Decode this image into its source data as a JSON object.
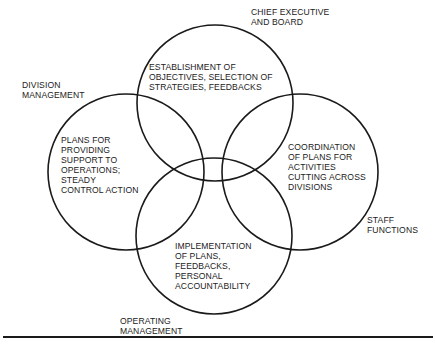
{
  "diagram": {
    "type": "venn",
    "circles": [
      {
        "id": "chief-executive",
        "label": "CHIEF EXECUTIVE\nAND BOARD",
        "text": "ESTABLISHMENT OF\nOBJECTIVES, SELECTION OF\nSTRATEGIES, FEEDBACKS",
        "cx": 215,
        "cy": 103,
        "r": 78
      },
      {
        "id": "division-management",
        "label": "DIVISION\nMANAGEMENT",
        "text": "PLANS FOR\nPROVIDING\nSUPPORT TO\nOPERATIONS;\nSTEADY\nCONTROL ACTION",
        "cx": 126,
        "cy": 172,
        "r": 78
      },
      {
        "id": "staff-functions",
        "label": "STAFF\nFUNCTIONS",
        "text": "COORDINATION\nOF PLANS FOR\nACTIVITIES\nCUTTING ACROSS\nDIVISIONS",
        "cx": 300,
        "cy": 172,
        "r": 78
      },
      {
        "id": "operating-management",
        "label": "OPERATING\nMANAGEMENT",
        "text": "IMPLEMENTATION\nOF PLANS,\nFEEDBACKS,\nPERSONAL\nACCOUNTABILITY",
        "cx": 214,
        "cy": 236,
        "r": 78
      }
    ],
    "stroke_color": "#1a1a1a"
  }
}
